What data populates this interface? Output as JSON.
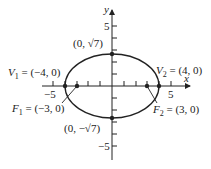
{
  "diagram": {
    "type": "ellipse-graph",
    "equation_params": {
      "a": 4,
      "b_label": "√7",
      "c": 3
    },
    "axes": {
      "x_label": "x",
      "y_label": "y",
      "x_ticks": {
        "neg": "−5",
        "pos": "5"
      },
      "y_ticks": {
        "pos": "5",
        "neg": "−5"
      }
    },
    "points": {
      "v1": {
        "name": "V",
        "sub": "1",
        "coords": " = (−4, 0)"
      },
      "v2": {
        "name": "V",
        "sub": "2",
        "coords": " = (4, 0)"
      },
      "f1": {
        "name": "F",
        "sub": "1",
        "coords": " = (−3, 0)"
      },
      "f2": {
        "name": "F",
        "sub": "2",
        "coords": " =  (3, 0)"
      },
      "top": {
        "label": "(0, √7)"
      },
      "bottom": {
        "label": "(0, −√7)"
      }
    },
    "colors": {
      "stroke": "#222222",
      "background": "#ffffff"
    }
  }
}
